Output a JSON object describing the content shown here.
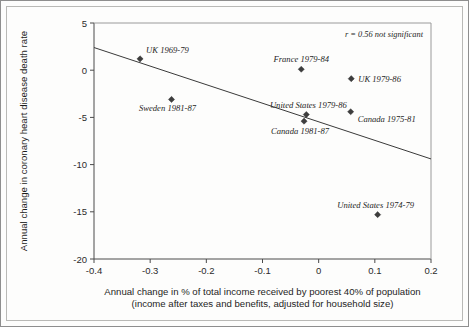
{
  "chart_data": {
    "type": "scatter",
    "title": "",
    "xlabel": "Annual change in % of total income received by poorest 40% of population",
    "xlabel_line2": "(income after taxes and benefits, adjusted for household size)",
    "ylabel": "Annual change in coronary heart disease death rate",
    "xlim": [
      -0.4,
      0.2
    ],
    "ylim": [
      -20,
      5
    ],
    "xticks": [
      "-0.4",
      "-0.3",
      "-0.2",
      "-0.1",
      "0",
      "0.1",
      "0.2"
    ],
    "xtick_values": [
      -0.4,
      -0.3,
      -0.2,
      -0.1,
      0,
      0.1,
      0.2
    ],
    "yticks": [
      "5",
      "0",
      "-5",
      "-10",
      "-15",
      "-20"
    ],
    "ytick_values": [
      5,
      0,
      -5,
      -10,
      -15,
      -20
    ],
    "grid": false,
    "legend": "none",
    "annotation": "r = 0.56 not significant",
    "points": [
      {
        "label": "UK 1969-79",
        "x": -0.318,
        "y": 1.2,
        "label_dx": 6,
        "label_dy": -6,
        "anchor": "start"
      },
      {
        "label": "Sweden 1981-87",
        "x": -0.262,
        "y": -3.1,
        "label_dx": -4,
        "label_dy": 12,
        "anchor": "middle"
      },
      {
        "label": "France 1979-84",
        "x": -0.031,
        "y": 0.1,
        "label_dx": 0,
        "label_dy": -7,
        "anchor": "middle"
      },
      {
        "label": "UK 1979-86",
        "x": 0.058,
        "y": -0.9,
        "label_dx": 7,
        "label_dy": 3,
        "anchor": "start"
      },
      {
        "label": "United States 1979-86",
        "x": -0.022,
        "y": -4.7,
        "label_dx": 2,
        "label_dy": -7,
        "anchor": "middle"
      },
      {
        "label": "Canada 1975-81",
        "x": 0.057,
        "y": -4.4,
        "label_dx": 7,
        "label_dy": 10,
        "anchor": "start"
      },
      {
        "label": "Canada 1981-87",
        "x": -0.026,
        "y": -5.4,
        "label_dx": -4,
        "label_dy": 13,
        "anchor": "middle"
      },
      {
        "label": "United States 1974-79",
        "x": 0.105,
        "y": -15.3,
        "label_dx": -2,
        "label_dy": -7,
        "anchor": "middle"
      }
    ],
    "trend_line": {
      "x_start": -0.4,
      "y_start": 2.4,
      "x_end": 0.2,
      "y_end": -9.4
    }
  }
}
